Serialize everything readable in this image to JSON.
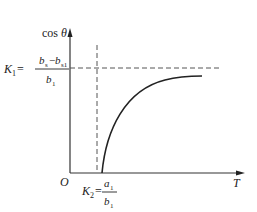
{
  "diagram": {
    "y_axis_label_prefix": "cos",
    "y_axis_label_symbol": "θ",
    "x_axis_label": "T",
    "origin_label": "O",
    "k1": {
      "name": "K",
      "sub": "1",
      "eq": "=",
      "numerator_a": "b",
      "numerator_a_sub": "s",
      "minus": "−",
      "numerator_b": "b",
      "numerator_b_sub": "s1",
      "denominator": "b",
      "denominator_sub": "1"
    },
    "k2": {
      "name": "K",
      "sub": "2",
      "eq": "=",
      "numerator": "a",
      "numerator_sub": "1",
      "denominator": "b",
      "denominator_sub": "1"
    },
    "colors": {
      "line": "#222222",
      "dash": "#555555"
    }
  }
}
